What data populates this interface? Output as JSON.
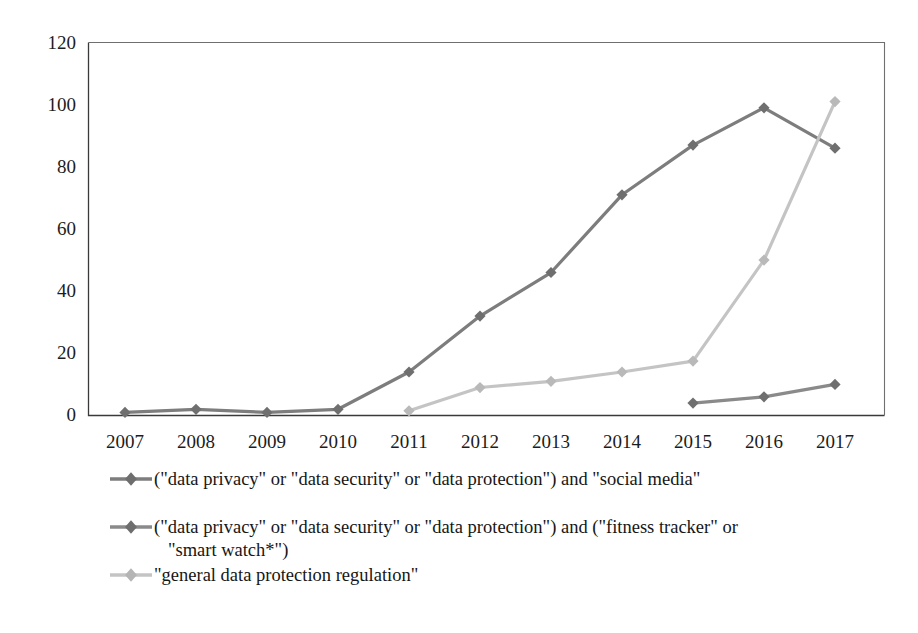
{
  "chart_data": {
    "type": "line",
    "title": "",
    "xlabel": "",
    "ylabel": "",
    "categories": [
      "2007",
      "2008",
      "2009",
      "2010",
      "2011",
      "2012",
      "2013",
      "2014",
      "2015",
      "2016",
      "2017"
    ],
    "x": [
      2007,
      2008,
      2009,
      2010,
      2011,
      2012,
      2013,
      2014,
      2015,
      2016,
      2017
    ],
    "ylim": [
      0,
      120
    ],
    "yticks": [
      0,
      20,
      40,
      60,
      80,
      100,
      120
    ],
    "grid": false,
    "legend_position": "below",
    "series": [
      {
        "name": "(\"data privacy\" or \"data security\" or \"data protection\") and \"social media\"",
        "color": "#7d7d7d",
        "marker": "diamond",
        "values": [
          1,
          2,
          1,
          2,
          14,
          32,
          46,
          71,
          87,
          99,
          86
        ]
      },
      {
        "name": "(\"data privacy\" or \"data security\" or \"data protection\") and (\"fitness tracker\" or \"smart watch*\")",
        "color": "#8a8a8a",
        "marker": "diamond",
        "values": [
          null,
          null,
          null,
          null,
          null,
          null,
          null,
          null,
          4,
          6,
          10
        ]
      },
      {
        "name": "\"general data protection regulation\"",
        "color": "#c4c4c4",
        "marker": "diamond",
        "values": [
          null,
          null,
          null,
          null,
          1.5,
          9,
          11,
          14,
          17.5,
          50,
          101
        ]
      }
    ]
  },
  "axis": {
    "y_tick_labels": [
      "120",
      "100",
      "80",
      "60",
      "40",
      "20",
      "0"
    ],
    "x_tick_labels": [
      "2007",
      "2008",
      "2009",
      "2010",
      "2011",
      "2012",
      "2013",
      "2014",
      "2015",
      "2016",
      "2017"
    ]
  },
  "legend": {
    "entries": [
      {
        "label": "(\"data privacy\" or \"data security\" or \"data protection\") and \"social media\"",
        "color": "#7d7d7d"
      },
      {
        "label": "(\"data privacy\" or \"data security\" or \"data protection\") and (\"fitness tracker\" or\n   \"smart watch*\")",
        "color": "#8a8a8a"
      },
      {
        "label": "\"general data protection regulation\"",
        "color": "#c4c4c4"
      }
    ]
  },
  "colors": {
    "series_dark": "#7d7d7d",
    "series_mid": "#8a8a8a",
    "series_light": "#c4c4c4",
    "axis": "#3a3a3a",
    "text": "#1a1a1a",
    "background": "#ffffff"
  }
}
